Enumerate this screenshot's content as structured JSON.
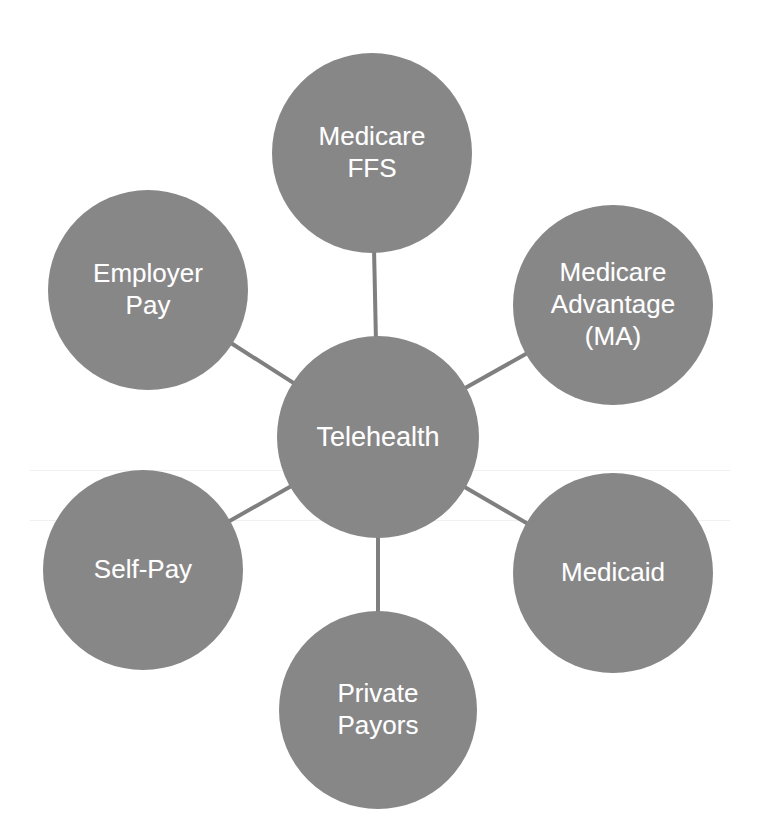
{
  "diagram": {
    "type": "hub-and-spoke",
    "canvas": {
      "width": 757,
      "height": 838,
      "background": "#ffffff"
    },
    "style": {
      "node_fill": "#878787",
      "node_text_color": "#ffffff",
      "connector_color": "#7f7f7f",
      "connector_width": 4
    },
    "center": {
      "id": "telehealth",
      "label": "Telehealth",
      "cx": 378,
      "cy": 437,
      "r": 101
    },
    "spokes": [
      {
        "id": "medicare-ffs",
        "label": "Medicare\nFFS",
        "cx": 372,
        "cy": 153,
        "r": 100
      },
      {
        "id": "medicare-advantage",
        "label": "Medicare\nAdvantage\n(MA)",
        "cx": 613,
        "cy": 305,
        "r": 100
      },
      {
        "id": "medicaid",
        "label": "Medicaid",
        "cx": 613,
        "cy": 573,
        "r": 100
      },
      {
        "id": "private-payors",
        "label": "Private\nPayors",
        "cx": 378,
        "cy": 710,
        "r": 99
      },
      {
        "id": "self-pay",
        "label": "Self-Pay",
        "cx": 143,
        "cy": 570,
        "r": 100
      },
      {
        "id": "employer-pay",
        "label": "Employer\nPay",
        "cx": 148,
        "cy": 290,
        "r": 100
      }
    ],
    "connectors": [
      {
        "from": "telehealth",
        "to": "medicare-ffs"
      },
      {
        "from": "telehealth",
        "to": "medicare-advantage"
      },
      {
        "from": "telehealth",
        "to": "medicaid"
      },
      {
        "from": "telehealth",
        "to": "private-payors"
      },
      {
        "from": "telehealth",
        "to": "self-pay"
      },
      {
        "from": "telehealth",
        "to": "employer-pay"
      }
    ]
  }
}
